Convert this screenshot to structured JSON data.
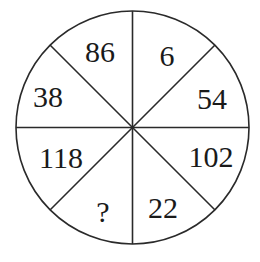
{
  "puzzle": {
    "type": "number-circle",
    "sectors": 8,
    "center": [
      132.5,
      127.5
    ],
    "radius": 116.5,
    "stroke_color": "#2a2a2a",
    "text_color": "#1a1a1a",
    "cells": [
      {
        "position": "top-right",
        "value": "6",
        "x": 167,
        "y": 66
      },
      {
        "position": "right-upper",
        "value": "54",
        "x": 212,
        "y": 109
      },
      {
        "position": "right-lower",
        "value": "102",
        "x": 211,
        "y": 167
      },
      {
        "position": "bottom-right",
        "value": "22",
        "x": 163,
        "y": 218
      },
      {
        "position": "bottom-left",
        "value": "?",
        "x": 103,
        "y": 222
      },
      {
        "position": "left-lower",
        "value": "118",
        "x": 61,
        "y": 168
      },
      {
        "position": "left-upper",
        "value": "38",
        "x": 48,
        "y": 107
      },
      {
        "position": "top-left",
        "value": "86",
        "x": 100,
        "y": 62
      }
    ]
  }
}
